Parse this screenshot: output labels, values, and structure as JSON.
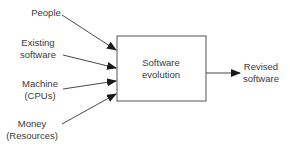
{
  "diagram": {
    "process": {
      "line1": "Software",
      "line2": "evolution"
    },
    "inputs": [
      {
        "line1": "People",
        "line2": ""
      },
      {
        "line1": "Existing",
        "line2": "software"
      },
      {
        "line1": "Machine",
        "line2": "(CPUs)"
      },
      {
        "line1": "Money",
        "line2": "(Resources)"
      }
    ],
    "output": {
      "line1": "Revised",
      "line2": "software"
    },
    "colors": {
      "line": "#2a2a2a",
      "text": "#3a3a3a",
      "background": "#ffffff"
    }
  }
}
